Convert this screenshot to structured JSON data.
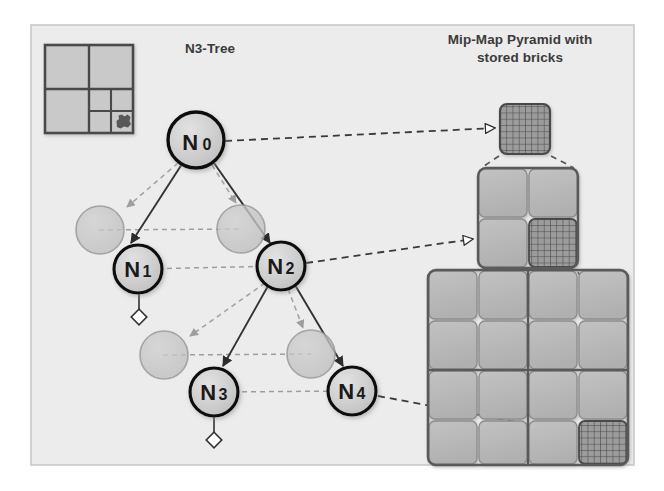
{
  "figure": {
    "background_color": "#ffffff",
    "frame_fill": "#ececec",
    "frame_stroke": "#c8c8c8"
  },
  "panels": {
    "left": {
      "title": "N3-Tree",
      "title_x": 210,
      "title_y": 53
    },
    "right": {
      "title_line1": "Mip-Map Pyramid with",
      "title_line2": "stored bricks",
      "title_x": 520,
      "title_y": 44,
      "title_y2": 62
    }
  },
  "quadtree_icon": {
    "name": "quadtree-thumbnail",
    "x": 45,
    "y": 45,
    "size": 88,
    "fill": "#c9c9c9",
    "stroke": "#4a4a4a",
    "blob_fill": "#585858"
  },
  "tree": {
    "node_fill": "#cfcfcf",
    "node_stroke": "#111111",
    "ghost_fill": "#c4c4c4",
    "ghost_stroke": "#9a9a9a",
    "solid_edge_color": "#3a3a3a",
    "dashed_edge_color": "#9a9a9a",
    "leaf_marker_fill": "#ffffff",
    "leaf_marker_stroke": "#333333",
    "nodes": [
      {
        "id": "N0",
        "label": "N",
        "sub": "0",
        "cx": 196,
        "cy": 140,
        "r": 28
      },
      {
        "id": "N1",
        "label": "N",
        "sub": "1",
        "cx": 138,
        "cy": 269,
        "r": 24
      },
      {
        "id": "N2",
        "label": "N",
        "sub": "2",
        "cx": 281,
        "cy": 266,
        "r": 24
      },
      {
        "id": "N3",
        "label": "N",
        "sub": "3",
        "cx": 214,
        "cy": 392,
        "r": 24
      },
      {
        "id": "N4",
        "label": "N",
        "sub": "4",
        "cx": 352,
        "cy": 391,
        "r": 24
      }
    ],
    "ghost_nodes": [
      {
        "id": "G1",
        "cx": 100,
        "cy": 230,
        "r": 24
      },
      {
        "id": "G2",
        "cx": 241,
        "cy": 229,
        "r": 24
      },
      {
        "id": "G3",
        "cx": 164,
        "cy": 355,
        "r": 24
      },
      {
        "id": "G4",
        "cx": 311,
        "cy": 354,
        "r": 24
      }
    ],
    "leaf_markers": [
      {
        "id": "L1",
        "cx": 139,
        "cy": 317,
        "from_x": 139,
        "from_y": 293
      },
      {
        "id": "L3",
        "cx": 214,
        "cy": 440,
        "from_x": 214,
        "from_y": 416
      }
    ]
  },
  "pyramid": {
    "cell_fill": "#b9b9b9",
    "cell_stroke": "#8d8d8d",
    "block_stroke": "#5a5a5a",
    "brick_fill": "#9a9a9a",
    "brick_line": "#4a4a4a",
    "levels": [
      {
        "id": "level-0",
        "x": 500,
        "y": 104,
        "size": 50,
        "divisions": 1,
        "brick_cell": "all"
      },
      {
        "id": "level-1",
        "x": 478,
        "y": 168,
        "size": 100,
        "divisions": 2,
        "brick_cell": "bottom-right"
      },
      {
        "id": "level-2",
        "x": 428,
        "y": 270,
        "size": 200,
        "divisions": 4,
        "brick_cell": "bottom-right"
      }
    ]
  },
  "links": [
    {
      "id": "link-n0-level0",
      "from": "N0",
      "to": "level-0"
    },
    {
      "id": "link-n2-level1",
      "from": "N2",
      "to": "level-1"
    },
    {
      "id": "link-n4-level2",
      "from": "N4",
      "to": "level-2"
    }
  ]
}
